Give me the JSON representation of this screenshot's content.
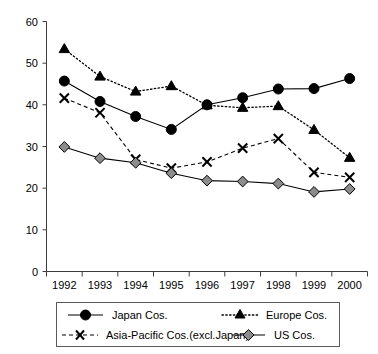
{
  "chart_data": {
    "type": "line",
    "title": "",
    "subtitle": "",
    "xlabel": "",
    "ylabel": "",
    "categories": [
      "1992",
      "1993",
      "1994",
      "1995",
      "1996",
      "1997",
      "1998",
      "1999",
      "2000"
    ],
    "ylim": [
      0,
      60
    ],
    "yticks": [
      0,
      10,
      20,
      30,
      40,
      50,
      60
    ],
    "ytick_labels": [
      "0",
      "10",
      "20",
      "30",
      "40",
      "50",
      "60"
    ],
    "grid": false,
    "legend_position": "bottom",
    "series": [
      {
        "name": "Japan Cos.",
        "marker": "circle-filled",
        "linestyle": "solid",
        "color": "#000000",
        "values": [
          45.7,
          40.8,
          37.2,
          34.1,
          40.0,
          41.7,
          43.8,
          43.9,
          46.3
        ]
      },
      {
        "name": "Europe Cos.",
        "marker": "triangle-filled",
        "linestyle": "dotted",
        "color": "#000000",
        "values": [
          53.4,
          46.8,
          43.2,
          44.5,
          39.9,
          39.3,
          39.7,
          34.0,
          27.3
        ]
      },
      {
        "name": "Asia-Pacific Cos.(excl.Japan)",
        "marker": "x-cross",
        "linestyle": "dashed",
        "color": "#000000",
        "values": [
          41.6,
          38.1,
          26.9,
          24.8,
          26.3,
          29.6,
          31.9,
          23.8,
          22.6
        ]
      },
      {
        "name": "US Cos.",
        "marker": "diamond-gray",
        "linestyle": "solid",
        "color": "#8c8c8c",
        "values": [
          29.9,
          27.2,
          26.1,
          23.6,
          21.8,
          21.6,
          21.1,
          19.1,
          19.8
        ]
      }
    ]
  },
  "legend": {
    "entries": [
      {
        "label": "Japan Cos.",
        "marker": "circle-filled",
        "linestyle": "solid"
      },
      {
        "label": "Europe Cos.",
        "marker": "triangle-filled",
        "linestyle": "dotted"
      },
      {
        "label": "Asia-Pacific Cos.(excl.Japan)",
        "marker": "x-cross",
        "linestyle": "dashed"
      },
      {
        "label": "US Cos.",
        "marker": "diamond-gray",
        "linestyle": "solid"
      }
    ]
  },
  "colors": {
    "axis": "#3c3c3c",
    "series_black": "#000000",
    "diamond_fill": "#8c8c8c",
    "legend_border": "#5a5a5a",
    "background": "#ffffff"
  }
}
